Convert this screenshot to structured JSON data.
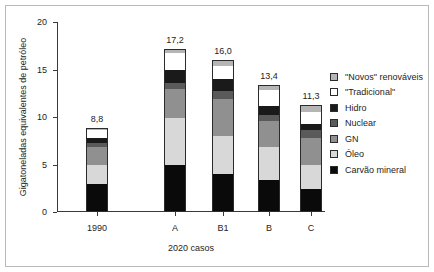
{
  "chart_data": {
    "type": "bar",
    "stacked": true,
    "title": "",
    "xlabel": "2020 casos",
    "ylabel": "Gigatoneladas equivalentes de petróleo",
    "categories": [
      "1990",
      "A",
      "B1",
      "B",
      "C"
    ],
    "ylim": [
      0,
      20
    ],
    "yticks": [
      0,
      5,
      10,
      15,
      20
    ],
    "ytick_labels": [
      "0",
      "5",
      "10",
      "15",
      "20"
    ],
    "grid": false,
    "legend_position": "right",
    "totals": [
      "8,8",
      "17,2",
      "16,0",
      "13,4",
      "11,3"
    ],
    "total_values": [
      8.8,
      17.2,
      16.0,
      13.4,
      11.3
    ],
    "series": [
      {
        "name": "Carvão mineral",
        "color": "#0a0a0a",
        "values": [
          3.0,
          5.0,
          4.0,
          3.4,
          2.4
        ]
      },
      {
        "name": "Óleo",
        "color": "#d8d8d8",
        "values": [
          2.0,
          4.9,
          4.0,
          3.4,
          2.5
        ]
      },
      {
        "name": "GN",
        "color": "#909090",
        "values": [
          1.8,
          3.0,
          3.9,
          2.8,
          2.9
        ]
      },
      {
        "name": "Nuclear",
        "color": "#5a5a5a",
        "values": [
          0.5,
          0.7,
          0.8,
          0.6,
          0.8
        ]
      },
      {
        "name": "Hidro",
        "color": "#1a1a1a",
        "values": [
          0.5,
          1.3,
          1.3,
          1.0,
          0.7
        ]
      },
      {
        "name": "\"Tradicional\"",
        "color": "#ffffff",
        "values": [
          0.8,
          1.8,
          1.4,
          1.6,
          1.2
        ]
      },
      {
        "name": "\"Novos\" renováveis",
        "color": "#b5b5b5",
        "values": [
          0.2,
          0.5,
          0.6,
          0.6,
          0.8
        ]
      }
    ],
    "legend_order": [
      "\"Novos\" renováveis",
      "\"Tradicional\"",
      "Hidro",
      "Nuclear",
      "GN",
      "Óleo",
      "Carvão mineral"
    ]
  }
}
